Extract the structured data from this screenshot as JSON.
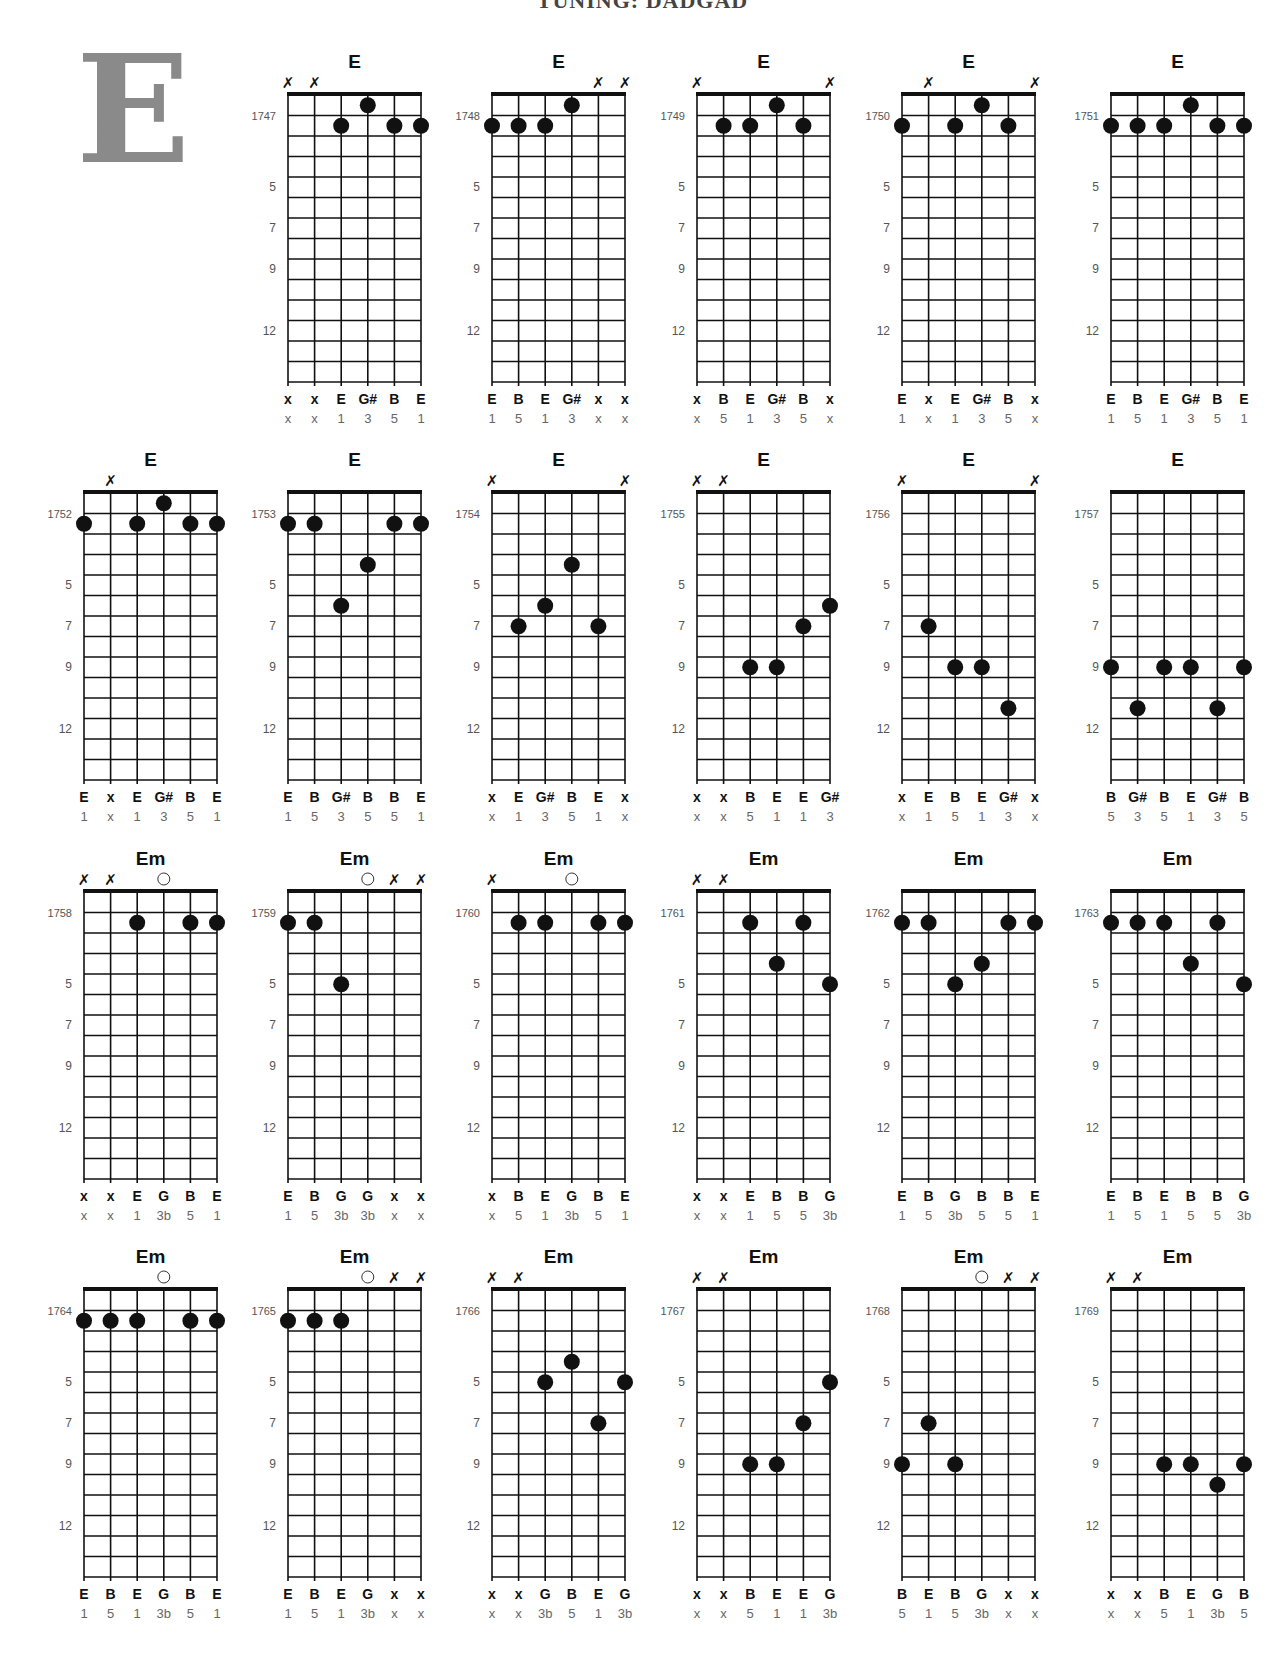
{
  "header": {
    "title": "TUNING: DADGAD"
  },
  "section_letter": "E",
  "layout": {
    "col_x": [
      84,
      288,
      492,
      697,
      902,
      1111
    ],
    "row_nut_y": [
      95,
      493,
      892,
      1290
    ],
    "string_spacing": 26.6,
    "fret_spacing": 20.5,
    "fret_count": 14,
    "fret_markers": [
      {
        "fret": 5,
        "label": "5"
      },
      {
        "fret": 7,
        "label": "7"
      },
      {
        "fret": 9,
        "label": "9"
      },
      {
        "fret": 12,
        "label": "12"
      }
    ]
  },
  "chords": [
    {
      "id": "1747",
      "name": "E",
      "row": 0,
      "col": 1,
      "strings": [
        "x",
        "x",
        2,
        1,
        2,
        2
      ],
      "notes": [
        "x",
        "x",
        "E",
        "G#",
        "B",
        "E"
      ],
      "intervals": [
        "x",
        "x",
        "1",
        "3",
        "5",
        "1"
      ]
    },
    {
      "id": "1748",
      "name": "E",
      "row": 0,
      "col": 2,
      "strings": [
        2,
        2,
        2,
        1,
        "x",
        "x"
      ],
      "notes": [
        "E",
        "B",
        "E",
        "G#",
        "x",
        "x"
      ],
      "intervals": [
        "1",
        "5",
        "1",
        "3",
        "x",
        "x"
      ]
    },
    {
      "id": "1749",
      "name": "E",
      "row": 0,
      "col": 3,
      "strings": [
        "x",
        2,
        2,
        1,
        2,
        "x"
      ],
      "notes": [
        "x",
        "B",
        "E",
        "G#",
        "B",
        "x"
      ],
      "intervals": [
        "x",
        "5",
        "1",
        "3",
        "5",
        "x"
      ]
    },
    {
      "id": "1750",
      "name": "E",
      "row": 0,
      "col": 4,
      "strings": [
        2,
        "x",
        2,
        1,
        2,
        "x"
      ],
      "notes": [
        "E",
        "x",
        "E",
        "G#",
        "B",
        "x"
      ],
      "intervals": [
        "1",
        "x",
        "1",
        "3",
        "5",
        "x"
      ]
    },
    {
      "id": "1751",
      "name": "E",
      "row": 0,
      "col": 5,
      "strings": [
        2,
        2,
        2,
        1,
        2,
        2
      ],
      "notes": [
        "E",
        "B",
        "E",
        "G#",
        "B",
        "E"
      ],
      "intervals": [
        "1",
        "5",
        "1",
        "3",
        "5",
        "1"
      ]
    },
    {
      "id": "1752",
      "name": "E",
      "row": 1,
      "col": 0,
      "strings": [
        2,
        "x",
        2,
        1,
        2,
        2
      ],
      "notes": [
        "E",
        "x",
        "E",
        "G#",
        "B",
        "E"
      ],
      "intervals": [
        "1",
        "x",
        "1",
        "3",
        "5",
        "1"
      ]
    },
    {
      "id": "1753",
      "name": "E",
      "row": 1,
      "col": 1,
      "strings": [
        2,
        2,
        6,
        4,
        2,
        2
      ],
      "notes": [
        "E",
        "B",
        "G#",
        "B",
        "B",
        "E"
      ],
      "intervals": [
        "1",
        "5",
        "3",
        "5",
        "5",
        "1"
      ]
    },
    {
      "id": "1754",
      "name": "E",
      "row": 1,
      "col": 2,
      "strings": [
        "x",
        7,
        6,
        4,
        7,
        "x"
      ],
      "notes": [
        "x",
        "E",
        "G#",
        "B",
        "E",
        "x"
      ],
      "intervals": [
        "x",
        "1",
        "3",
        "5",
        "1",
        "x"
      ]
    },
    {
      "id": "1755",
      "name": "E",
      "row": 1,
      "col": 3,
      "strings": [
        "x",
        "x",
        9,
        9,
        7,
        6
      ],
      "notes": [
        "x",
        "x",
        "B",
        "E",
        "E",
        "G#"
      ],
      "intervals": [
        "x",
        "x",
        "5",
        "1",
        "1",
        "3"
      ]
    },
    {
      "id": "1756",
      "name": "E",
      "row": 1,
      "col": 4,
      "strings": [
        "x",
        7,
        9,
        9,
        11,
        "x"
      ],
      "notes": [
        "x",
        "E",
        "B",
        "E",
        "G#",
        "x"
      ],
      "intervals": [
        "x",
        "1",
        "5",
        "1",
        "3",
        "x"
      ]
    },
    {
      "id": "1757",
      "name": "E",
      "row": 1,
      "col": 5,
      "strings": [
        9,
        11,
        9,
        9,
        11,
        9
      ],
      "notes": [
        "B",
        "G#",
        "B",
        "E",
        "G#",
        "B"
      ],
      "intervals": [
        "5",
        "3",
        "5",
        "1",
        "3",
        "5"
      ]
    },
    {
      "id": "1758",
      "name": "Em",
      "row": 2,
      "col": 0,
      "strings": [
        "x",
        "x",
        2,
        0,
        2,
        2
      ],
      "notes": [
        "x",
        "x",
        "E",
        "G",
        "B",
        "E"
      ],
      "intervals": [
        "x",
        "x",
        "1",
        "3b",
        "5",
        "1"
      ]
    },
    {
      "id": "1759",
      "name": "Em",
      "row": 2,
      "col": 1,
      "strings": [
        2,
        2,
        5,
        0,
        "x",
        "x"
      ],
      "notes": [
        "E",
        "B",
        "G",
        "G",
        "x",
        "x"
      ],
      "intervals": [
        "1",
        "5",
        "3b",
        "3b",
        "x",
        "x"
      ]
    },
    {
      "id": "1760",
      "name": "Em",
      "row": 2,
      "col": 2,
      "strings": [
        "x",
        2,
        2,
        0,
        2,
        2
      ],
      "notes": [
        "x",
        "B",
        "E",
        "G",
        "B",
        "E"
      ],
      "intervals": [
        "x",
        "5",
        "1",
        "3b",
        "5",
        "1"
      ]
    },
    {
      "id": "1761",
      "name": "Em",
      "row": 2,
      "col": 3,
      "strings": [
        "x",
        "x",
        2,
        4,
        2,
        5
      ],
      "notes": [
        "x",
        "x",
        "E",
        "B",
        "B",
        "G"
      ],
      "intervals": [
        "x",
        "x",
        "1",
        "5",
        "5",
        "3b"
      ]
    },
    {
      "id": "1762",
      "name": "Em",
      "row": 2,
      "col": 4,
      "strings": [
        2,
        2,
        5,
        4,
        2,
        2
      ],
      "notes": [
        "E",
        "B",
        "G",
        "B",
        "B",
        "E"
      ],
      "intervals": [
        "1",
        "5",
        "3b",
        "5",
        "5",
        "1"
      ]
    },
    {
      "id": "1763",
      "name": "Em",
      "row": 2,
      "col": 5,
      "strings": [
        2,
        2,
        2,
        4,
        2,
        5
      ],
      "notes": [
        "E",
        "B",
        "E",
        "B",
        "B",
        "G"
      ],
      "intervals": [
        "1",
        "5",
        "1",
        "5",
        "5",
        "3b"
      ]
    },
    {
      "id": "1764",
      "name": "Em",
      "row": 3,
      "col": 0,
      "strings": [
        2,
        2,
        2,
        0,
        2,
        2
      ],
      "notes": [
        "E",
        "B",
        "E",
        "G",
        "B",
        "E"
      ],
      "intervals": [
        "1",
        "5",
        "1",
        "3b",
        "5",
        "1"
      ]
    },
    {
      "id": "1765",
      "name": "Em",
      "row": 3,
      "col": 1,
      "strings": [
        2,
        2,
        2,
        0,
        "x",
        "x"
      ],
      "notes": [
        "E",
        "B",
        "E",
        "G",
        "x",
        "x"
      ],
      "intervals": [
        "1",
        "5",
        "1",
        "3b",
        "x",
        "x"
      ]
    },
    {
      "id": "1766",
      "name": "Em",
      "row": 3,
      "col": 2,
      "strings": [
        "x",
        "x",
        5,
        4,
        7,
        5
      ],
      "notes": [
        "x",
        "x",
        "G",
        "B",
        "E",
        "G"
      ],
      "intervals": [
        "x",
        "x",
        "3b",
        "5",
        "1",
        "3b"
      ]
    },
    {
      "id": "1767",
      "name": "Em",
      "row": 3,
      "col": 3,
      "strings": [
        "x",
        "x",
        9,
        9,
        7,
        5
      ],
      "notes": [
        "x",
        "x",
        "B",
        "E",
        "E",
        "G"
      ],
      "intervals": [
        "x",
        "x",
        "5",
        "1",
        "1",
        "3b"
      ]
    },
    {
      "id": "1768",
      "name": "Em",
      "row": 3,
      "col": 4,
      "strings": [
        9,
        7,
        9,
        0,
        "x",
        "x"
      ],
      "notes": [
        "B",
        "E",
        "B",
        "G",
        "x",
        "x"
      ],
      "intervals": [
        "5",
        "1",
        "5",
        "3b",
        "x",
        "x"
      ]
    },
    {
      "id": "1769",
      "name": "Em",
      "row": 3,
      "col": 5,
      "strings": [
        "x",
        "x",
        9,
        9,
        10,
        9
      ],
      "notes": [
        "x",
        "x",
        "B",
        "E",
        "G",
        "B"
      ],
      "intervals": [
        "x",
        "x",
        "5",
        "1",
        "3b",
        "5"
      ]
    }
  ],
  "icons": {
    "muted_string": "✗",
    "open_string": "○",
    "fretted_dot": "●"
  }
}
